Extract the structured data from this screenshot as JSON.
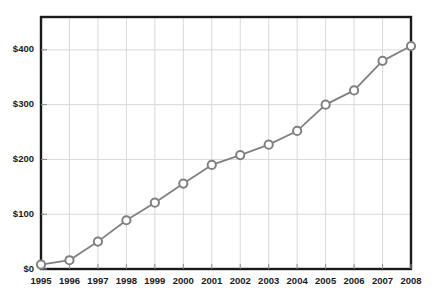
{
  "chart_data": {
    "type": "line",
    "title": "",
    "subtitle": "",
    "xlabel": "",
    "ylabel": "",
    "grid": true,
    "legend": "none",
    "categories": [
      "1995",
      "1996",
      "1997",
      "1998",
      "1999",
      "2000",
      "2001",
      "2002",
      "2003",
      "2004",
      "2005",
      "2006",
      "2007",
      "2008"
    ],
    "x": [
      1995,
      1996,
      1997,
      1998,
      1999,
      2000,
      2001,
      2002,
      2003,
      2004,
      2005,
      2006,
      2007,
      2008
    ],
    "values": [
      8,
      16,
      50,
      89,
      121,
      156,
      190,
      208,
      227,
      252,
      300,
      326,
      380,
      407
    ],
    "series": [
      {
        "name": "",
        "values": [
          8,
          16,
          50,
          89,
          121,
          156,
          190,
          208,
          227,
          252,
          300,
          326,
          380,
          407
        ]
      }
    ],
    "ylim": [
      0,
      460
    ],
    "xlim": [
      1995,
      2008
    ],
    "ytick_values": [
      0,
      100,
      200,
      300,
      400
    ],
    "ytick_labels": [
      "$0",
      "$100",
      "$200",
      "$300",
      "$400"
    ],
    "xtick_labels": [
      "1995",
      "1996",
      "1997",
      "1998",
      "1999",
      "2000",
      "2001",
      "2002",
      "2003",
      "2004",
      "2005",
      "2006",
      "2007",
      "2008"
    ],
    "line_color": "#808080",
    "marker_color": "#808080",
    "marker_fill": "#ffffff",
    "grid_color": "#d9d9d9",
    "axis_color": "#1a1a1a",
    "background_color": "#ffffff",
    "marker_style": "open-circle"
  }
}
